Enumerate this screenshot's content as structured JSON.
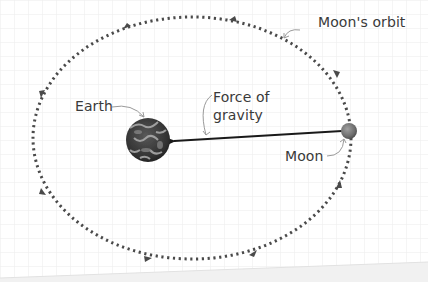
{
  "diagram": {
    "labels": {
      "orbit": "Moon's orbit",
      "earth": "Earth",
      "force_line1": "Force of",
      "force_line2": "gravity",
      "moon": "Moon"
    },
    "elements": {
      "earth": {
        "cx": 148,
        "cy": 140,
        "r": 22
      },
      "moon": {
        "cx": 349,
        "cy": 131,
        "r": 8
      },
      "orbit": {
        "cx": 192,
        "cy": 138,
        "rx": 159,
        "ry": 121,
        "direction": "counter-clockwise"
      },
      "gravity_arrow": {
        "from": "moon",
        "to": "earth"
      }
    },
    "colors": {
      "paper": "#ffffff",
      "grid": "#ececec",
      "orbit_dots": "#4a4a4a",
      "arrow": "#1a1a1a",
      "text": "#3a3a3a",
      "leader": "#9a9a9a",
      "moon": "#7a7a7a",
      "earth_dark": "#2e2e2e",
      "earth_light": "#a8a8a8"
    }
  }
}
